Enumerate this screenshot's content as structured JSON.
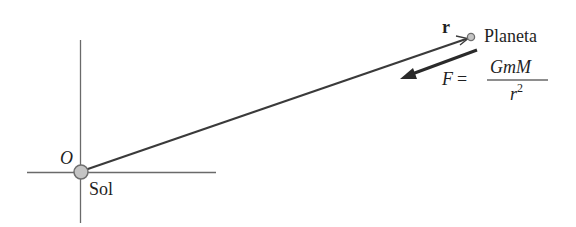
{
  "diagram": {
    "type": "physics-diagram",
    "labels": {
      "origin": "O",
      "sun": "Sol",
      "planet": "Planeta",
      "position_vector": "r",
      "force_lhs": "F =",
      "force_numerator": "GmM",
      "force_denominator_base": "r",
      "force_denominator_exp": "2"
    },
    "colors": {
      "line": "#3a3a3a",
      "axis": "#6a6a6a",
      "body_fill": "#c4c4c4",
      "body_stroke": "#6e6e6e",
      "text": "#1f1f1f"
    }
  }
}
